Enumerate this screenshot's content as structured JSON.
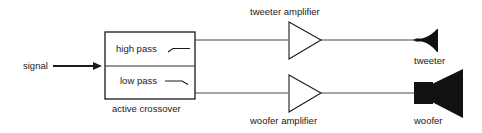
{
  "diagram": {
    "input": {
      "label": "signal"
    },
    "crossover": {
      "label": "active crossover",
      "filters": [
        {
          "label": "high pass",
          "icon": "high-pass-curve-icon"
        },
        {
          "label": "low pass",
          "icon": "low-pass-curve-icon"
        }
      ]
    },
    "amplifiers": [
      {
        "label": "tweeter amplifier",
        "icon": "amplifier-triangle-icon"
      },
      {
        "label": "woofer amplifier",
        "icon": "amplifier-triangle-icon"
      }
    ],
    "speakers": [
      {
        "label": "tweeter",
        "icon": "tweeter-horn-icon"
      },
      {
        "label": "woofer",
        "icon": "woofer-speaker-icon"
      }
    ],
    "edges": [
      {
        "from": "signal",
        "to": "active crossover"
      },
      {
        "from": "high pass",
        "to": "tweeter amplifier"
      },
      {
        "from": "low pass",
        "to": "woofer amplifier"
      },
      {
        "from": "tweeter amplifier",
        "to": "tweeter"
      },
      {
        "from": "woofer amplifier",
        "to": "woofer"
      }
    ],
    "colors": {
      "stroke": "#1a1a1a",
      "fill": "#111111",
      "background": "#ffffff"
    }
  }
}
